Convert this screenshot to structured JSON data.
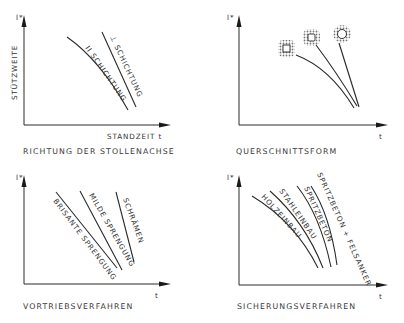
{
  "panels": [
    {
      "id": "richtung",
      "y_axis_label": "STÜTZWEITE",
      "y_axis_symbol": "l*",
      "x_axis_label": "STANDZEIT t",
      "caption": "RICHTUNG DER STOLLENACHSE",
      "curves": [
        {
          "label": "II SCHICHTUNG"
        },
        {
          "label": "⊥ SCHICHTUNG"
        }
      ]
    },
    {
      "id": "querschnitt",
      "y_axis_symbol": "l*",
      "x_axis_label": "t",
      "caption": "QUERSCHNITTSFORM",
      "curves": [
        {
          "label": "square-cross-section"
        },
        {
          "label": "rounded-square-cross-section"
        },
        {
          "label": "circular-cross-section"
        }
      ]
    },
    {
      "id": "vortrieb",
      "y_axis_symbol": "l*",
      "x_axis_label": "t",
      "caption": "VORTRIEBSVERFAHREN",
      "curves": [
        {
          "label": "BRISANTE SPRENGUNG"
        },
        {
          "label": "MILDE SPRENGUNG"
        },
        {
          "label": "SCHRÄMEN"
        }
      ]
    },
    {
      "id": "sicherung",
      "y_axis_symbol": "l*",
      "x_axis_label": "t",
      "caption": "SICHERUNGSVERFAHREN",
      "curves": [
        {
          "label": "HOLZEINBAU"
        },
        {
          "label": "STAHLEINBAU"
        },
        {
          "label": "SPRITZBETON"
        },
        {
          "label": "SPRITZBETON + FELSANKER"
        }
      ]
    }
  ]
}
